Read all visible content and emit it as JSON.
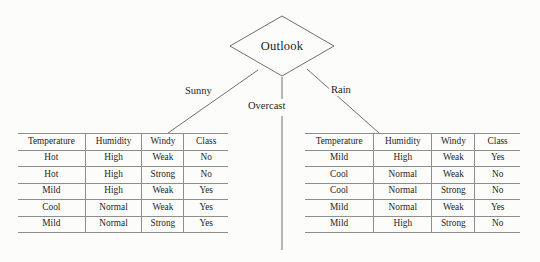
{
  "diagram": {
    "root": {
      "label": "Outlook",
      "shape": "diamond"
    },
    "branches": [
      {
        "label": "Sunny",
        "direction": "left"
      },
      {
        "label": "Overcast",
        "direction": "center"
      },
      {
        "label": "Rain",
        "direction": "right"
      }
    ],
    "colors": {
      "background": "#fcfcfa",
      "line": "#6f6f6f",
      "table_rule": "#8e8e8e",
      "text": "#1d1d1d"
    }
  },
  "tables": {
    "columns": [
      "Temperature",
      "Humidity",
      "Windy",
      "Class"
    ],
    "left": {
      "branch": "Sunny",
      "rows": [
        [
          "Hot",
          "High",
          "Weak",
          "No"
        ],
        [
          "Hot",
          "High",
          "Strong",
          "No"
        ],
        [
          "Mild",
          "High",
          "Weak",
          "Yes"
        ],
        [
          "Cool",
          "Normal",
          "Weak",
          "Yes"
        ],
        [
          "Mild",
          "Normal",
          "Strong",
          "Yes"
        ]
      ]
    },
    "right": {
      "branch": "Rain",
      "rows": [
        [
          "Mild",
          "High",
          "Weak",
          "Yes"
        ],
        [
          "Cool",
          "Normal",
          "Weak",
          "No"
        ],
        [
          "Cool",
          "Normal",
          "Strong",
          "No"
        ],
        [
          "Mild",
          "Normal",
          "Weak",
          "Yes"
        ],
        [
          "Mild",
          "High",
          "Strong",
          "No"
        ]
      ]
    }
  }
}
